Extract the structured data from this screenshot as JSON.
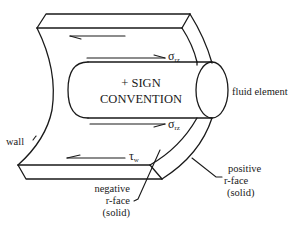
{
  "diagram": {
    "title": "+ SIGN CONVENTION",
    "cylinder_label_line1": "+ SIGN",
    "cylinder_label_line2": "CONVENTION",
    "labels": {
      "fluid_element": "fluid element",
      "wall": "wall",
      "negative_face_line1": "negative",
      "negative_face_line2": "r-face",
      "negative_face_line3": "(solid)",
      "positive_face_line1": "positive",
      "positive_face_line2": "r-face",
      "positive_face_line3": "(solid)"
    },
    "symbols": {
      "sigma": "σ",
      "sigma_sub": "rz",
      "tau": "τ",
      "tau_sub": "w"
    },
    "colors": {
      "line": "#1a1a1a",
      "background": "#ffffff"
    }
  }
}
